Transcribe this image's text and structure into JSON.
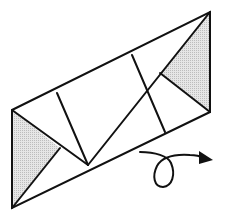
{
  "diagram": {
    "type": "origami-instruction",
    "colors": {
      "background": "#ffffff",
      "line": "#111111",
      "shade": "#d8d8d8"
    },
    "outline": {
      "points": [
        [
          12,
          110
        ],
        [
          210,
          12
        ],
        [
          210,
          112
        ],
        [
          12,
          208
        ]
      ]
    },
    "shaded_triangles": [
      {
        "name": "left-flap",
        "points": [
          [
            12,
            110
          ],
          [
            60,
            148
          ],
          [
            12,
            208
          ]
        ]
      },
      {
        "name": "right-flap",
        "points": [
          [
            210,
            12
          ],
          [
            160,
            73
          ],
          [
            210,
            112
          ]
        ]
      }
    ],
    "crease_lines": [
      {
        "name": "left-flap-edge-top",
        "from": [
          12,
          110
        ],
        "to": [
          88,
          165
        ]
      },
      {
        "name": "left-flap-edge-bottom",
        "from": [
          60,
          148
        ],
        "to": [
          12,
          208
        ]
      },
      {
        "name": "left-inner-fold",
        "from": [
          57,
          93
        ],
        "to": [
          88,
          165
        ]
      },
      {
        "name": "diagonal-fold",
        "from": [
          88,
          165
        ],
        "to": [
          210,
          12
        ]
      },
      {
        "name": "right-flap-edge-bottom",
        "from": [
          160,
          73
        ],
        "to": [
          210,
          112
        ]
      },
      {
        "name": "right-inner-fold",
        "from": [
          132,
          55
        ],
        "to": [
          165,
          132
        ]
      }
    ],
    "action_symbol": {
      "name": "turn-over-arrow",
      "label": "Turn over"
    }
  }
}
